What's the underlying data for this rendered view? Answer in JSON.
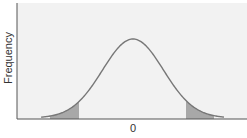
{
  "chart_data": {
    "type": "area",
    "title": "",
    "xlabel": "",
    "ylabel": "Frequency",
    "x_ticks": [
      "0"
    ],
    "y_ticks": [],
    "grid": false,
    "legend": null,
    "distribution": "normal",
    "mean": 0,
    "series": [
      {
        "name": "normal-curve",
        "x": [
          -3,
          -2.5,
          -2,
          -1.5,
          -1,
          -0.5,
          0,
          0.5,
          1,
          1.5,
          2,
          2.5,
          3
        ],
        "values": [
          0.004,
          0.018,
          0.054,
          0.13,
          0.242,
          0.352,
          0.399,
          0.352,
          0.242,
          0.13,
          0.054,
          0.018,
          0.004
        ]
      }
    ],
    "shaded_regions": [
      {
        "name": "left-tail",
        "from": -2.6,
        "to": -1.7
      },
      {
        "name": "right-tail",
        "from": 1.7,
        "to": 2.6
      }
    ]
  },
  "axis": {
    "ylabel": "Frequency",
    "xtick": "0"
  },
  "colors": {
    "background": "#f2f2f2",
    "curve": "#777777",
    "shade": "#a8a8a8",
    "axis": "#555555"
  }
}
